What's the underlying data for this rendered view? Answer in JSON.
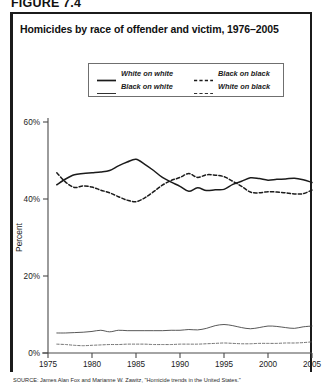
{
  "figure": {
    "number": "FIGURE 7.4",
    "title": "Homicides by race of offender and victim, 1976–2005",
    "source": "SOURCE: James Alan Fox and Marianne W. Zawitz, \"Homicide trends in the United States.\""
  },
  "chart_data": {
    "type": "line",
    "title": "Homicides by race of offender and victim, 1976–2005",
    "xlabel": "",
    "ylabel": "Percent",
    "xlim": [
      1975,
      2005
    ],
    "ylim": [
      0,
      60
    ],
    "xticks": [
      1975,
      1980,
      1985,
      1990,
      1995,
      2000,
      2005
    ],
    "yticks": [
      0,
      20,
      40,
      60
    ],
    "ytick_labels": [
      "0%",
      "20%",
      "40%",
      "60%"
    ],
    "xtick_labels": [
      "1975",
      "1980",
      "1985",
      "1990",
      "1995",
      "2000",
      "2005"
    ],
    "grid": false,
    "legend_position": "top-center",
    "x": [
      1976,
      1977,
      1978,
      1979,
      1980,
      1981,
      1982,
      1983,
      1984,
      1985,
      1986,
      1987,
      1988,
      1989,
      1990,
      1991,
      1992,
      1993,
      1994,
      1995,
      1996,
      1997,
      1998,
      1999,
      2000,
      2001,
      2002,
      2003,
      2004,
      2005
    ],
    "series": [
      {
        "name": "White on white",
        "style": "solid",
        "width": "thick",
        "color": "#1b1b1b",
        "values": [
          43.7,
          45.2,
          46.3,
          46.6,
          46.8,
          47.0,
          47.4,
          48.6,
          49.6,
          50.3,
          49.0,
          47.4,
          45.6,
          44.4,
          43.3,
          42.0,
          42.9,
          42.2,
          42.4,
          42.5,
          43.8,
          44.6,
          45.5,
          45.3,
          44.9,
          45.1,
          45.2,
          45.4,
          45.0,
          44.3
        ]
      },
      {
        "name": "Black on black",
        "style": "dashed",
        "width": "thick",
        "color": "#1b1b1b",
        "values": [
          46.8,
          44.4,
          43.0,
          43.4,
          43.1,
          42.3,
          41.6,
          40.6,
          39.7,
          39.3,
          40.3,
          41.9,
          43.6,
          44.8,
          45.6,
          46.6,
          45.6,
          46.3,
          46.2,
          45.8,
          44.6,
          43.3,
          41.8,
          41.6,
          41.9,
          41.8,
          41.6,
          41.3,
          41.4,
          42.3
        ]
      },
      {
        "name": "Black on white",
        "style": "solid",
        "width": "thin",
        "color": "#3a3a3a",
        "values": [
          5.2,
          5.2,
          5.3,
          5.4,
          5.6,
          5.9,
          5.5,
          5.9,
          5.8,
          5.8,
          5.8,
          5.8,
          5.8,
          5.9,
          5.9,
          6.1,
          6.0,
          6.4,
          7.1,
          7.4,
          7.1,
          6.6,
          6.3,
          6.6,
          7.0,
          6.9,
          6.6,
          6.4,
          6.8,
          7.0
        ]
      },
      {
        "name": "White on black",
        "style": "dashed",
        "width": "thin",
        "color": "#5a5a5a",
        "values": [
          2.3,
          2.2,
          2.0,
          1.9,
          2.0,
          2.1,
          2.2,
          2.2,
          2.3,
          2.3,
          2.3,
          2.2,
          2.2,
          2.2,
          2.3,
          2.3,
          2.3,
          2.4,
          2.5,
          2.6,
          2.5,
          2.4,
          2.4,
          2.5,
          2.5,
          2.5,
          2.6,
          2.6,
          2.7,
          2.9
        ]
      }
    ],
    "legend": [
      {
        "label": "White on white",
        "style": "solid",
        "width": "thick"
      },
      {
        "label": "Black on black",
        "style": "dashed",
        "width": "thick"
      },
      {
        "label": "Black on white",
        "style": "solid",
        "width": "thin"
      },
      {
        "label": "White on black",
        "style": "dashed",
        "width": "thin"
      }
    ]
  }
}
